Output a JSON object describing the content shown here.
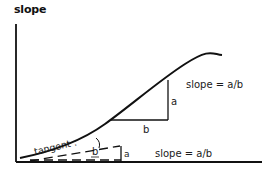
{
  "title": "slope",
  "labels": {
    "upper_slope": "slope = a/b",
    "lower_slope": "slope = a/b",
    "tangent": "tangent :",
    "upper_a": "a",
    "upper_b": "b",
    "lower_a": "a",
    "lower_b": "b"
  },
  "colors": {
    "ink": "#111111",
    "background": "#ffffff"
  }
}
